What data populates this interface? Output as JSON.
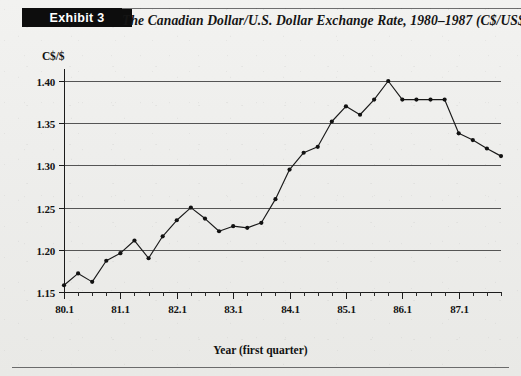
{
  "exhibit": {
    "badge_label": "Exhibit 3",
    "title": "The Canadian Dollar/U.S. Dollar Exchange Rate, 1980–1987 (C$/US$)"
  },
  "axes": {
    "y_axis_label": "C$/$",
    "x_axis_label": "Year (first quarter)",
    "y_tick_labels": [
      "1.40",
      "1.35",
      "1.30",
      "1.25",
      "1.20",
      "1.15"
    ],
    "x_tick_labels": [
      "80.1",
      "81.1",
      "82.1",
      "83.1",
      "84.1",
      "85.1",
      "86.1",
      "87.1"
    ]
  },
  "colors": {
    "line": "#1a1a1a",
    "marker": "#121212",
    "grid": "#555555",
    "axis": "#1c1c1c",
    "badge_background": "#0d0d0d",
    "badge_text": "#ffffff",
    "page_background": "#eeeeec"
  },
  "chart_data": {
    "type": "line",
    "title": "The Canadian Dollar/U.S. Dollar Exchange Rate, 1980–1987 (C$/US$)",
    "xlabel": "Year (first quarter)",
    "ylabel": "C$/$",
    "ylim": [
      1.15,
      1.4
    ],
    "ytick_values": [
      1.15,
      1.2,
      1.25,
      1.3,
      1.35,
      1.4
    ],
    "grid": true,
    "legend": "none",
    "x_major_labels": [
      "80.1",
      "81.1",
      "82.1",
      "83.1",
      "84.1",
      "85.1",
      "86.1",
      "87.1"
    ],
    "x_major_indices": [
      0,
      4,
      8,
      12,
      16,
      20,
      24,
      28
    ],
    "x": [
      "80.1",
      "80.2",
      "80.3",
      "80.4",
      "81.1",
      "81.2",
      "81.3",
      "81.4",
      "82.1",
      "82.2",
      "82.3",
      "82.4",
      "83.1",
      "83.2",
      "83.3",
      "83.4",
      "84.1",
      "84.2",
      "84.3",
      "84.4",
      "85.1",
      "85.2",
      "85.3",
      "85.4",
      "86.1",
      "86.2",
      "86.3",
      "86.4",
      "87.1",
      "87.2",
      "87.3",
      "87.4"
    ],
    "series": [
      {
        "name": "C$/US$ exchange rate",
        "values": [
          1.158,
          1.172,
          1.162,
          1.187,
          1.196,
          1.211,
          1.19,
          1.216,
          1.235,
          1.25,
          1.237,
          1.222,
          1.228,
          1.226,
          1.232,
          1.26,
          1.295,
          1.315,
          1.322,
          1.352,
          1.37,
          1.36,
          1.378,
          1.4,
          1.378,
          1.378,
          1.378,
          1.378,
          1.338,
          1.33,
          1.32,
          1.311
        ]
      }
    ]
  }
}
